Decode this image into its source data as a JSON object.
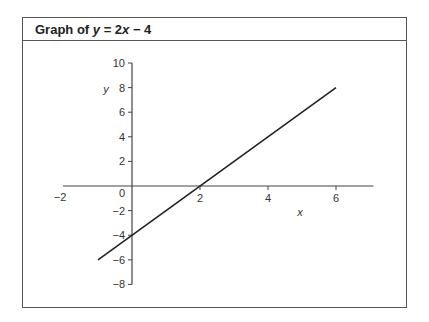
{
  "figure": {
    "title_prefix": "Graph of ",
    "title_var": "y",
    "title_eq": " = 2",
    "title_var2": "x",
    "title_suffix": " − 4"
  },
  "chart_data": {
    "type": "line",
    "title": "Graph of y = 2x − 4",
    "xlabel": "x",
    "ylabel": "y",
    "xlim": [
      -2,
      7
    ],
    "ylim": [
      -8,
      10
    ],
    "x_ticks": [
      -2,
      2,
      4,
      6
    ],
    "x_tick_labels": [
      "−2",
      "2",
      "4",
      "6"
    ],
    "y_ticks": [
      10,
      8,
      6,
      4,
      2,
      -2,
      -4,
      -6,
      -8
    ],
    "y_tick_labels": [
      "10",
      "8",
      "6",
      "4",
      "2",
      "−2",
      "−4",
      "−6",
      "−8"
    ],
    "origin_label": "0",
    "grid": false,
    "legend": null,
    "series": [
      {
        "name": "y = 2x − 4",
        "x": [
          -1,
          6
        ],
        "y": [
          -6,
          8
        ]
      }
    ]
  }
}
